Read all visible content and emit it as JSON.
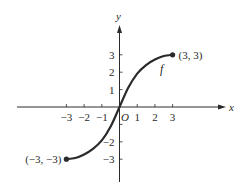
{
  "chart_data": {
    "type": "line",
    "title": "",
    "xlabel": "x",
    "ylabel": "y",
    "xlim": [
      -6,
      6
    ],
    "ylim": [
      -4.3,
      5
    ],
    "grid": false,
    "origin_label": "O",
    "x_ticks": [
      -3,
      -2,
      -1,
      1,
      2,
      3
    ],
    "x_tick_labels": [
      "−3",
      "−2",
      "−1",
      "1",
      "2",
      "3"
    ],
    "y_ticks": [
      -3,
      -2,
      -1,
      1,
      2,
      3
    ],
    "y_tick_labels": [
      "−3",
      "−2",
      "",
      "1",
      "2",
      "3"
    ],
    "series": [
      {
        "name": "f",
        "label": "f",
        "description": "smooth increasing S-shaped curve from (-3,-3) to (3,3) through origin",
        "x": [
          -3,
          -2.5,
          -2,
          -1.5,
          -1,
          -0.5,
          0,
          0.5,
          1,
          1.5,
          2,
          2.5,
          3
        ],
        "y": [
          -3,
          -2.93,
          -2.73,
          -2.41,
          -1.92,
          -1.12,
          0,
          1.12,
          1.92,
          2.41,
          2.73,
          2.93,
          3
        ]
      }
    ],
    "endpoints": [
      {
        "x": -3,
        "y": -3,
        "label": "(−3, −3)",
        "filled": true
      },
      {
        "x": 3,
        "y": 3,
        "label": "(3, 3)",
        "filled": true
      }
    ],
    "colors": {
      "ink": "#2a2a2a",
      "background": "#ffffff"
    }
  }
}
